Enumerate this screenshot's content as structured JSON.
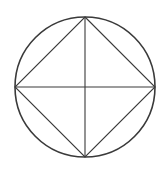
{
  "diagram": {
    "stroke_color": "#3a3a3a",
    "background": "#ffffff",
    "circle": {
      "cx": 85,
      "cy": 87,
      "r": 70
    },
    "square_vertices": {
      "top": [
        85,
        17
      ],
      "right": [
        155,
        87
      ],
      "bottom": [
        85,
        157
      ],
      "left": [
        15,
        87
      ]
    },
    "diagonals": [
      {
        "name": "vertical",
        "from": [
          85,
          17
        ],
        "to": [
          85,
          157
        ]
      },
      {
        "name": "horizontal",
        "from": [
          15,
          87
        ],
        "to": [
          155,
          87
        ]
      }
    ]
  }
}
